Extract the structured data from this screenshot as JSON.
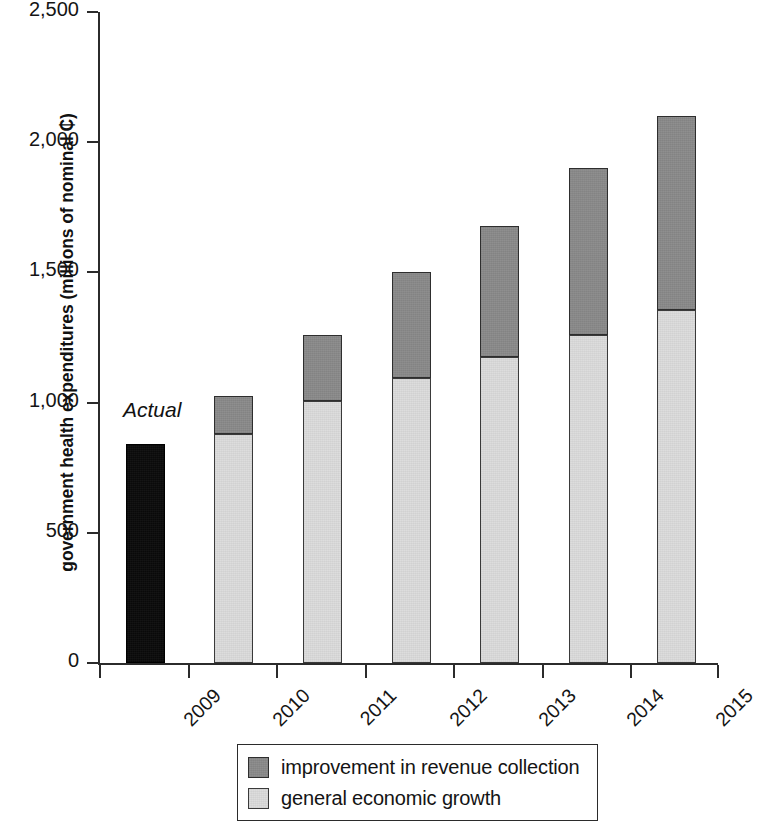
{
  "chart_data": {
    "type": "bar",
    "stacked": true,
    "title": "",
    "subtitle": "",
    "xlabel": "",
    "ylabel": "government health expenditures (millions of nominal ₵)",
    "categories": [
      "2009",
      "2010",
      "2011",
      "2012",
      "2013",
      "2014",
      "2015"
    ],
    "ylim": [
      0,
      2500
    ],
    "yticks": [
      0,
      500,
      1000,
      1500,
      2000,
      2500
    ],
    "ytick_labels": [
      "0",
      "500",
      "1,000",
      "1,500",
      "2,000",
      "2,500"
    ],
    "grid": false,
    "legend_position": "bottom",
    "series": [
      {
        "name": "actual",
        "color": "#0a0a0a",
        "in_legend": false,
        "values": [
          840,
          0,
          0,
          0,
          0,
          0,
          0
        ]
      },
      {
        "name": "general economic growth",
        "color": "#dcdcdc",
        "in_legend": true,
        "values": [
          0,
          880,
          1005,
          1095,
          1175,
          1260,
          1355
        ]
      },
      {
        "name": "improvement in revenue collection",
        "color": "#8a8a8a",
        "in_legend": true,
        "values": [
          0,
          145,
          255,
          405,
          505,
          640,
          745
        ]
      }
    ],
    "totals": [
      840,
      1025,
      1260,
      1500,
      1680,
      1900,
      2100
    ],
    "annotations": [
      {
        "text": "Actual",
        "category": "2009",
        "style": "italic"
      }
    ]
  },
  "axis": {
    "y_title": "government health expenditures (millions of nominal ₵)",
    "y_tick_labels": [
      "2,500",
      "2,000",
      "1,500",
      "1,000",
      "500",
      "0"
    ],
    "x_tick_labels": [
      "2009",
      "2010",
      "2011",
      "2012",
      "2013",
      "2014",
      "2015"
    ]
  },
  "annotation": {
    "actual_label": "Actual"
  },
  "legend": {
    "items": [
      {
        "label": "improvement in revenue collection",
        "swatch": "dark-gray"
      },
      {
        "label": "general economic growth",
        "swatch": "light-gray"
      }
    ]
  },
  "colors": {
    "revenue_improvement": "#8a8a8a",
    "economic_growth": "#dcdcdc",
    "actual": "#0a0a0a",
    "axis": "#2b2b2b",
    "background": "#ffffff"
  }
}
